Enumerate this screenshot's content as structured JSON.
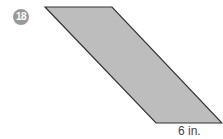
{
  "problem": {
    "number": "18",
    "badge_color": "#9a9a9a",
    "shape": "parallelogram",
    "fill_color": "#bdbdbd",
    "stroke_color": "#333333",
    "base_label": "6 in."
  }
}
